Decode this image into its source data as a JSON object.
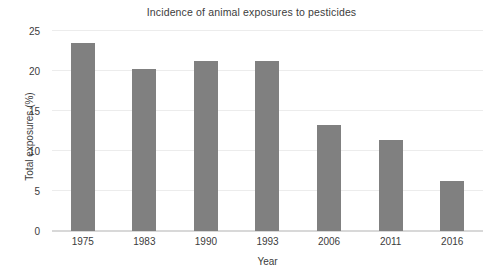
{
  "chart_data": {
    "type": "bar",
    "title": "Incidence of animal exposures to pesticides",
    "xlabel": "Year",
    "ylabel": "Total exposures (%)",
    "categories": [
      "1975",
      "1983",
      "1990",
      "1993",
      "2006",
      "2011",
      "2016"
    ],
    "values": [
      23.5,
      20.2,
      21.2,
      21.3,
      13.3,
      11.4,
      6.3
    ],
    "ylim": [
      0,
      25
    ],
    "yticks": [
      0,
      5,
      10,
      15,
      20,
      25
    ],
    "ytick_labels": [
      "0",
      "5",
      "10",
      "15",
      "20",
      "25"
    ],
    "grid": true,
    "grid_axis": "y",
    "legend": false,
    "bar_color": "#808080",
    "grid_color": "#ececec",
    "axis_color": "#d8d8d8",
    "background_color": "#ffffff"
  }
}
